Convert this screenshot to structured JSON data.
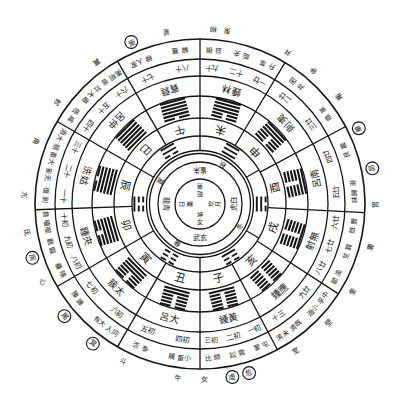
{
  "colors": {
    "ink": "#151515",
    "paper": "#ffffff"
  },
  "diagram": {
    "center": [
      {
        "trigram": "乾",
        "meaning": "男"
      },
      {
        "trigram": "坎",
        "meaning": "月"
      },
      {
        "trigram": "坤",
        "meaning": "女"
      },
      {
        "trigram": "離",
        "meaning": "日"
      }
    ],
    "four_symbols": [
      "朱雀",
      "白虎",
      "玄武",
      "青龍"
    ],
    "seasons": [
      "秋",
      "冬",
      "春",
      "夏"
    ],
    "inner_trigrams": [
      {
        "id": "qian-trigram",
        "lines": "111"
      },
      {
        "id": "dui-trigram",
        "lines": "110"
      },
      {
        "id": "zhen-trigram",
        "lines": "100"
      },
      {
        "id": "kun-trigram",
        "lines": "000"
      },
      {
        "id": "gen-trigram",
        "lines": "001"
      },
      {
        "id": "xun-trigram",
        "lines": "011"
      }
    ],
    "earthly_branches": [
      "子",
      "丑",
      "寅",
      "卯",
      "辰",
      "巳",
      "午",
      "未",
      "申",
      "酉",
      "戌",
      "亥"
    ],
    "sovereign_hexagrams": [
      {
        "id": "fu-hexagram",
        "lines": "100000"
      },
      {
        "id": "lin-hexagram",
        "lines": "110000"
      },
      {
        "id": "tai-hexagram",
        "lines": "111000"
      },
      {
        "id": "da-zhuang-hexagram",
        "lines": "111100"
      },
      {
        "id": "guai-hexagram",
        "lines": "111110"
      },
      {
        "id": "qian-hexagram",
        "lines": "111111"
      },
      {
        "id": "gou-hexagram",
        "lines": "011111"
      },
      {
        "id": "dun-hexagram",
        "lines": "001111"
      },
      {
        "id": "pi-hexagram",
        "lines": "000111"
      },
      {
        "id": "guan-hexagram",
        "lines": "000011"
      },
      {
        "id": "bo-hexagram",
        "lines": "000001"
      },
      {
        "id": "kun-hexagram",
        "lines": "000000"
      }
    ],
    "pitch_pipes": [
      "黃鍾",
      "大呂",
      "太簇",
      "夾鍾",
      "姑洗",
      "仲呂",
      "蕤賓",
      "林鍾",
      "夷則",
      "南呂",
      "無射",
      "應鍾"
    ],
    "days": [
      {
        "day": "初一",
        "hexagrams": [
          "屯",
          "蒙"
        ]
      },
      {
        "day": "初二",
        "hexagrams": [
          "需",
          "訟"
        ]
      },
      {
        "day": "初三",
        "hexagrams": [
          "師",
          "比"
        ]
      },
      {
        "day": "初四",
        "hexagrams": [
          "小畜",
          "履"
        ]
      },
      {
        "day": "初五",
        "hexagrams": [
          "泰",
          "否"
        ]
      },
      {
        "day": "初六",
        "hexagrams": [
          "同人",
          "大有"
        ]
      },
      {
        "day": "初七",
        "hexagrams": [
          "謙",
          "豫"
        ]
      },
      {
        "day": "初八",
        "hexagrams": [
          "隨",
          "蠱"
        ]
      },
      {
        "day": "初九",
        "hexagrams": [
          "臨",
          "觀"
        ]
      },
      {
        "day": "初十",
        "hexagrams": [
          "噬嗑",
          "賁"
        ]
      },
      {
        "day": "十一",
        "hexagrams": [
          "剝",
          "復"
        ]
      },
      {
        "day": "十二",
        "hexagrams": [
          "无妄",
          "大畜"
        ]
      },
      {
        "day": "十三",
        "hexagrams": [
          "頤",
          "大過"
        ]
      },
      {
        "day": "十四",
        "hexagrams": [
          "咸",
          "恆"
        ]
      },
      {
        "day": "十五",
        "hexagrams": [
          "遯",
          "大壯"
        ]
      },
      {
        "day": "十六",
        "hexagrams": [
          "晉",
          "明夷"
        ]
      },
      {
        "day": "十七",
        "hexagrams": [
          "家人",
          "睽"
        ]
      },
      {
        "day": "十八",
        "hexagrams": [
          "蹇",
          "解"
        ]
      },
      {
        "day": "十九",
        "hexagrams": [
          "損",
          "益"
        ]
      },
      {
        "day": "二十",
        "hexagrams": [
          "夬",
          "姤"
        ]
      },
      {
        "day": "廿一",
        "hexagrams": [
          "萃",
          "升"
        ]
      },
      {
        "day": "廿二",
        "hexagrams": [
          "困",
          "井"
        ]
      },
      {
        "day": "廿三",
        "hexagrams": [
          "革",
          "鼎"
        ]
      },
      {
        "day": "廿四",
        "hexagrams": [
          "震",
          "艮"
        ]
      },
      {
        "day": "廿五",
        "hexagrams": [
          "漸",
          "歸妹"
        ]
      },
      {
        "day": "廿六",
        "hexagrams": [
          "豐",
          "旅"
        ]
      },
      {
        "day": "廿七",
        "hexagrams": [
          "巽",
          "兌"
        ]
      },
      {
        "day": "廿八",
        "hexagrams": [
          "渙",
          "節"
        ]
      },
      {
        "day": "廿九",
        "hexagrams": [
          "中孚",
          "小過"
        ]
      },
      {
        "day": "三十",
        "hexagrams": [
          "既濟",
          "未濟"
        ]
      }
    ],
    "lunar_mansions": [
      {
        "name": "角",
        "circled": false
      },
      {
        "name": "亢",
        "circled": false
      },
      {
        "name": "氐",
        "circled": false
      },
      {
        "name": "房",
        "circled": true
      },
      {
        "name": "心",
        "circled": false
      },
      {
        "name": "尾",
        "circled": true
      },
      {
        "name": "箕",
        "circled": true
      },
      {
        "name": "斗",
        "circled": false
      },
      {
        "name": "牛",
        "circled": false
      },
      {
        "name": "女",
        "circled": false
      },
      {
        "name": "虛",
        "circled": true
      },
      {
        "name": "危",
        "circled": true
      },
      {
        "name": "室",
        "circled": false
      },
      {
        "name": "壁",
        "circled": false
      },
      {
        "name": "奎",
        "circled": false
      },
      {
        "name": "婁",
        "circled": false
      },
      {
        "name": "胃",
        "circled": false
      },
      {
        "name": "昴",
        "circled": true
      },
      {
        "name": "畢",
        "circled": true
      },
      {
        "name": "觜",
        "circled": false
      },
      {
        "name": "參",
        "circled": false
      },
      {
        "name": "井",
        "circled": false
      },
      {
        "name": "鬼",
        "circled": false
      },
      {
        "name": "柳",
        "circled": false
      },
      {
        "name": "星",
        "circled": false
      },
      {
        "name": "張",
        "circled": true
      },
      {
        "name": "翼",
        "circled": false
      },
      {
        "name": "軫",
        "circled": false
      }
    ]
  }
}
